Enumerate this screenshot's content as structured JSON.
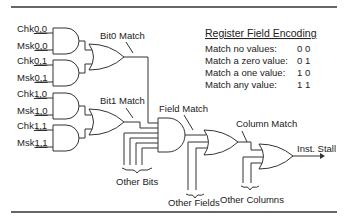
{
  "diagram": {
    "inputs": [
      {
        "prefix": "Chk",
        "suffix": "0,0"
      },
      {
        "prefix": "Msk",
        "suffix": "0,0"
      },
      {
        "prefix": "Chk",
        "suffix": "0,1"
      },
      {
        "prefix": "Msk",
        "suffix": "0,1"
      },
      {
        "prefix": "Chk",
        "suffix": "1,0"
      },
      {
        "prefix": "Msk",
        "suffix": "1,0"
      },
      {
        "prefix": "Chk",
        "suffix": "1,1"
      },
      {
        "prefix": "Msk",
        "suffix": "1,1"
      }
    ],
    "labels": {
      "bit0_match": "Bit0 Match",
      "bit1_match": "Bit1 Match",
      "field_match": "Field Match",
      "column_match": "Column Match",
      "inst_stall": "Inst. Stall",
      "other_bits": "Other Bits",
      "other_fields": "Other Fields",
      "other_columns": "Other Columns"
    },
    "encoding": {
      "title": "Register Field Encoding",
      "rows": [
        {
          "label": "Match no values:",
          "value": "0 0"
        },
        {
          "label": "Match a zero value:",
          "value": "0 1"
        },
        {
          "label": "Match a one value:",
          "value": "1 0"
        },
        {
          "label": "Match any value:",
          "value": "1 1"
        }
      ]
    },
    "colors": {
      "line": "#333333",
      "background": "#ffffff"
    }
  }
}
